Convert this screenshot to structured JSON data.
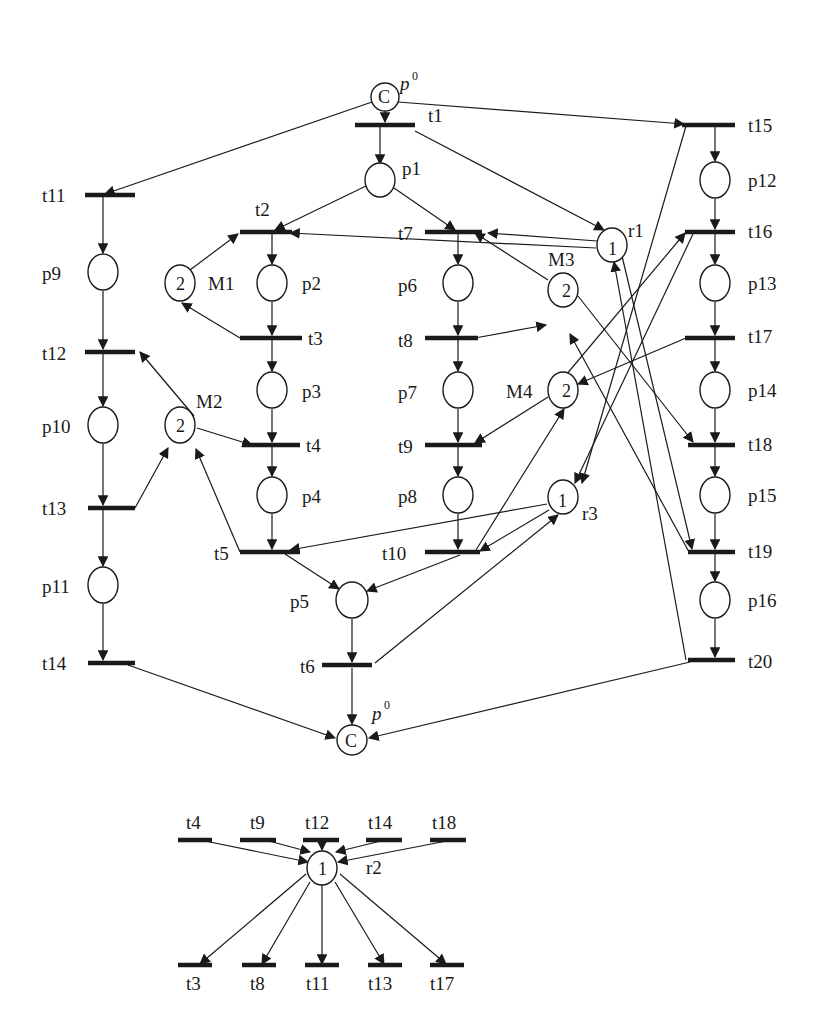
{
  "diagram": {
    "type": "petri-net",
    "places": {
      "p0_top": {
        "label": "p",
        "sup": "0",
        "token": "C"
      },
      "p0_bottom": {
        "label": "p",
        "sup": "0",
        "token": "C"
      },
      "p1": {
        "label": "p1"
      },
      "p2": {
        "label": "p2"
      },
      "p3": {
        "label": "p3"
      },
      "p4": {
        "label": "p4"
      },
      "p5": {
        "label": "p5"
      },
      "p6": {
        "label": "p6"
      },
      "p7": {
        "label": "p7"
      },
      "p8": {
        "label": "p8"
      },
      "p9": {
        "label": "p9"
      },
      "p10": {
        "label": "p10"
      },
      "p11": {
        "label": "p11"
      },
      "p12": {
        "label": "p12"
      },
      "p13": {
        "label": "p13"
      },
      "p14": {
        "label": "p14"
      },
      "p15": {
        "label": "p15"
      },
      "p16": {
        "label": "p16"
      },
      "M1": {
        "label": "M1",
        "token": "2"
      },
      "M2": {
        "label": "M2",
        "token": "2"
      },
      "M3": {
        "label": "M3",
        "token": "2"
      },
      "M4": {
        "label": "M4",
        "token": "2"
      },
      "r1": {
        "label": "r1",
        "token": "1"
      },
      "r2": {
        "label": "r2",
        "token": "1"
      },
      "r3": {
        "label": "r3",
        "token": "1"
      }
    },
    "transitions": {
      "t1": "t1",
      "t2": "t2",
      "t3": "t3",
      "t4": "t4",
      "t5": "t5",
      "t6": "t6",
      "t7": "t7",
      "t8": "t8",
      "t9": "t9",
      "t10": "t10",
      "t11": "t11",
      "t12": "t12",
      "t13": "t13",
      "t14": "t14",
      "t15": "t15",
      "t16": "t16",
      "t17": "t17",
      "t18": "t18",
      "t19": "t19",
      "t20": "t20"
    },
    "r2_subnet": {
      "inputs": [
        "t4",
        "t9",
        "t12",
        "t14",
        "t18"
      ],
      "outputs": [
        "t3",
        "t8",
        "t11",
        "t13",
        "t17"
      ]
    }
  }
}
